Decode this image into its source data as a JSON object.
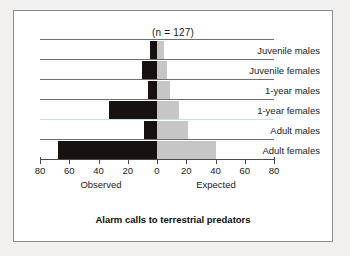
{
  "chart_data": {
    "type": "bar",
    "orientation": "horizontal",
    "style": "back-to-back-diverging",
    "title": "Alarm calls to terrestrial predators",
    "annotation": "(n = 127)",
    "sample_size": 127,
    "categories": [
      "Juvenile males",
      "Juvenile females",
      "1-year males",
      "1-year females",
      "Adult males",
      "Adult females"
    ],
    "series": [
      {
        "name": "Observed",
        "side": "left",
        "color": "#17120f",
        "values": [
          5,
          10,
          6,
          33,
          9,
          68
        ]
      },
      {
        "name": "Expected",
        "side": "right",
        "color": "#c6c6c6",
        "values": [
          5,
          7,
          9,
          15,
          21,
          40
        ]
      }
    ],
    "xlabel_left": "Observed",
    "xlabel_right": "Expected",
    "ylabel": "",
    "xlim": [
      -80,
      80
    ],
    "xticks": [
      -80,
      -60,
      -40,
      -20,
      0,
      20,
      40,
      60,
      80
    ],
    "xticklabels": [
      "80",
      "60",
      "40",
      "20",
      "0",
      "20",
      "40",
      "60",
      "80"
    ],
    "grid": "horizontal-row-rules",
    "legend": "none"
  },
  "figure": {
    "n_caption": "(n = 127)",
    "title": "Alarm calls to terrestrial predators",
    "axis_label_left": "Observed",
    "axis_label_right": "Expected"
  },
  "colors": {
    "observed": "#17120f",
    "expected": "#c6c6c6",
    "rule": "#6f6f6f",
    "teal_rule": "#bfe4e4",
    "border": "#8d8d8d",
    "background": "#ffffff",
    "page": "#f2f0ee"
  }
}
